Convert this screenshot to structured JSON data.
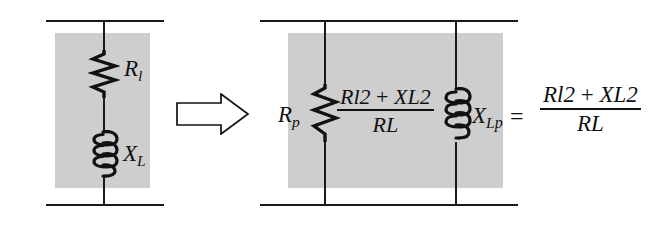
{
  "figure": {
    "background_color": "#ffffff",
    "shade_color": "#cecece",
    "line_color": "#1a1a1a"
  },
  "left_circuit": {
    "name": "series RL branch",
    "resistor_label": {
      "base": "R",
      "sub": "l"
    },
    "inductor_label": {
      "base": "X",
      "sub": "L"
    }
  },
  "transform_arrow": {
    "direction": "right",
    "style": "hollow-block-arrow"
  },
  "right_circuit": {
    "name": "parallel equivalent branch",
    "resistor_label": {
      "base": "R",
      "sub": "p"
    },
    "inductor_label": {
      "base": "X",
      "sub": "L",
      "subsub": "p"
    },
    "resistor_value": {
      "numerator": {
        "t1_base": "R",
        "t1_sub": "l",
        "t1_sup": "2",
        "op": "+",
        "t2_base": "X",
        "t2_sub": "L",
        "t2_sup": "2"
      },
      "denominator": {
        "base": "R",
        "sub": "L"
      }
    }
  },
  "equation": {
    "equals": "=",
    "right_side": {
      "numerator": {
        "t1_base": "R",
        "t1_sub": "l",
        "t1_sup": "2",
        "op": "+",
        "t2_base": "X",
        "t2_sub": "L",
        "t2_sup": "2"
      },
      "denominator": {
        "base": "R",
        "sub": "L"
      }
    }
  }
}
